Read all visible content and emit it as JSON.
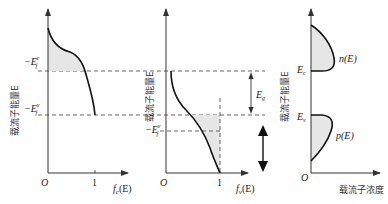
{
  "figure": {
    "colors": {
      "line": "#1a1a1a",
      "axis": "#333333",
      "dash": "#555555",
      "fill": "#e6e6e6"
    },
    "panel1": {
      "y_label": "载流子能量E",
      "x_label": "f_c(E)",
      "x_label_main": "f",
      "x_label_sub": "c",
      "x_label_tail": "(E)",
      "origin": "O",
      "tick_one": "1",
      "level_top": "−E",
      "level_top_sup": "c",
      "level_top_sub": "f",
      "level_bottom": "−E",
      "level_bottom_sup": "v",
      "level_bottom_sub": "f"
    },
    "panel2": {
      "y_label": "载流子能量E",
      "x_label": "f_v(E)",
      "x_label_main": "f",
      "x_label_sub": "v",
      "x_label_tail": "(E)",
      "origin": "O",
      "tick_one": "1",
      "level_mid": "−E",
      "level_mid_sup": "v",
      "level_mid_sub": "f",
      "gap_label": "E",
      "gap_label_sub": "g"
    },
    "panel3": {
      "y_label": "载流子能量E",
      "x_label": "载流子浓度",
      "origin": "O",
      "ec_label": "E",
      "ec_sub": "c",
      "ev_label": "E",
      "ev_sub": "v",
      "n_label": "n(E)",
      "p_label": "p(E)"
    }
  }
}
